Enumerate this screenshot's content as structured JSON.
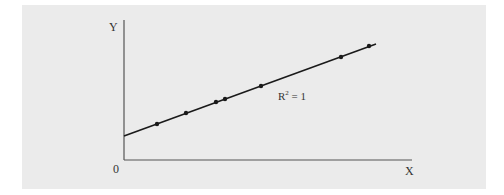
{
  "colors": {
    "background": "#ffffff",
    "panel": "#ebebeb",
    "axis": "#555555",
    "line": "#1a1a1a",
    "text": "#333333"
  },
  "labels": {
    "y_axis": "Y",
    "x_axis": "X",
    "origin": "0",
    "annotation_main": "R",
    "annotation_sup": "2",
    "annotation_rest": " = 1"
  },
  "chart_data": {
    "type": "scatter",
    "title": "",
    "xlabel": "X",
    "ylabel": "Y",
    "origin_label": "0",
    "annotation": "R² = 1",
    "grid": false,
    "legend": null,
    "fit_line": {
      "intercept_px_y": 136,
      "x_start_px": 124,
      "x_end_px": 376,
      "y_end_px": 44
    },
    "points": [
      {
        "x": 33,
        "y": 36
      },
      {
        "x": 62,
        "y": 47
      },
      {
        "x": 92,
        "y": 58
      },
      {
        "x": 101,
        "y": 61
      },
      {
        "x": 137,
        "y": 74
      },
      {
        "x": 217,
        "y": 103
      },
      {
        "x": 245,
        "y": 114
      }
    ],
    "point_units": "relative pixels from origin (x right, y up); axes have no numeric ticks",
    "xlim": [
      0,
      288
    ],
    "ylim": [
      0,
      140
    ]
  }
}
